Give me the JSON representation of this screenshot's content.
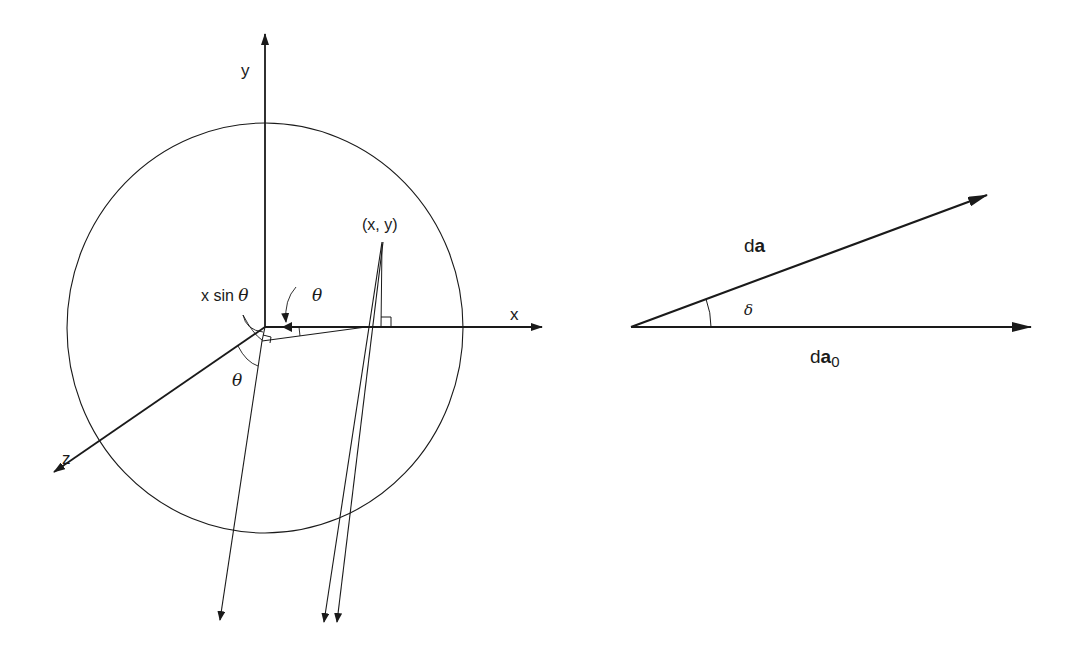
{
  "figure": {
    "left_panel": {
      "name": "sphere-projection-geometry",
      "axis_labels": {
        "x": "x",
        "y": "y",
        "z": "z"
      },
      "point_label": "(x, y)",
      "path_difference_label": "x sin θ",
      "angle_labels": {
        "upper": "θ",
        "lower": "θ"
      },
      "circle": {
        "cx": 265,
        "cy": 328,
        "rx": 198,
        "ry": 205
      }
    },
    "right_panel": {
      "name": "vector-angle-diagram",
      "vector_da_label": "d",
      "vector_da_bold": "a",
      "vector_da0_label": "d",
      "vector_da0_bold": "a",
      "vector_da0_subscript": "0",
      "angle_label": "δ"
    },
    "colors": {
      "stroke": "#1a1a1a",
      "background": "#ffffff"
    }
  }
}
